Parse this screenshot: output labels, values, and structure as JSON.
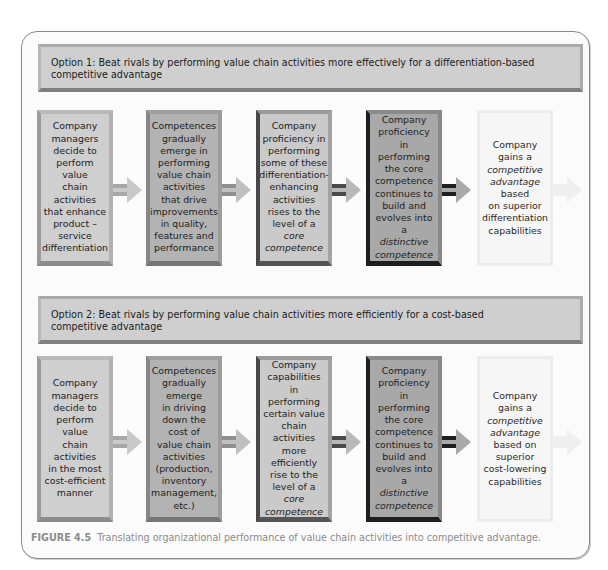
{
  "top_clipped_text": "competitive advantage — partially cut off page text above the figure",
  "option1": {
    "header": "Option 1: Beat rivals by performing value chain activities more effectively for a differentiation-based competitive advantage",
    "header_line1": "Option 1: Beat rivals by performing value chain activities more effectively for a differentiation-based",
    "header_line2": "competitive advantage",
    "boxes": [
      {
        "lines": [
          "Company",
          "managers",
          "decide to",
          "perform",
          "value",
          "chain",
          "activities",
          "that enhance",
          "product –",
          "service",
          "differentiation"
        ]
      },
      {
        "lines": [
          "Competences",
          "gradually",
          "emerge in",
          "performing",
          "value chain",
          "activities",
          "that drive",
          "improvements",
          "in quality,",
          "features and",
          "performance"
        ]
      },
      {
        "lines": [
          "Company",
          "proficiency in",
          "performing",
          "some of these",
          "differentiation-",
          "enhancing",
          "activities",
          "rises to the",
          "level of a",
          "core",
          "competence"
        ],
        "italic_from": 9
      },
      {
        "lines": [
          "Company",
          "proficiency in",
          "performing",
          "the core",
          "competence",
          "continues to",
          "build and",
          "evolves into a",
          "distinctive",
          "competence"
        ],
        "italic_from": 8
      },
      {
        "lines": [
          "Company",
          "gains a",
          "competitive",
          "advantage",
          "based",
          "on superior",
          "differentiation",
          "capabilities"
        ],
        "italic_lines": [
          2,
          3
        ]
      }
    ]
  },
  "option2": {
    "header": "Option 2: Beat rivals by performing value chain activities more efficiently for a cost-based competitive advantage",
    "header_line1": "Option 2: Beat rivals by performing value chain activities more efficiently for a cost-based",
    "header_line2": "competitive advantage",
    "boxes": [
      {
        "lines": [
          "Company",
          "managers",
          "decide to",
          "perform",
          "value",
          "chain",
          "activities",
          "in the most",
          "cost-efficient",
          "manner"
        ]
      },
      {
        "lines": [
          "Competences",
          "gradually",
          "emerge",
          "in driving",
          "down the",
          "cost of",
          "value chain",
          "activities",
          "(production,",
          "inventory",
          "management,",
          "etc.)"
        ]
      },
      {
        "lines": [
          "Company",
          "capabilities in",
          "performing",
          "certain value",
          "chain activities",
          "more",
          "efficiently",
          "rise to the",
          "level of a",
          "core",
          "competence"
        ],
        "italic_from": 9
      },
      {
        "lines": [
          "Company",
          "proficiency in",
          "performing",
          "the core",
          "competence",
          "continues to",
          "build and",
          "evolves into a",
          "distinctive",
          "competence"
        ],
        "italic_from": 8
      },
      {
        "lines": [
          "Company",
          "gains a",
          "competitive",
          "advantage",
          "based on",
          "superior",
          "cost-lowering",
          "capabilities"
        ],
        "italic_lines": [
          2,
          3
        ]
      }
    ]
  },
  "arrows": {
    "icon": "right-arrow-icon",
    "colors": [
      "#c4c4c4",
      "#b6b6b6",
      "#a0a0a0",
      "#2a2a2a"
    ],
    "final_arrow_color": "#ececec"
  },
  "caption": {
    "label": "FIGURE 4.5",
    "text": "Translating organizational performance of value chain activities into competitive advantage."
  },
  "colors": {
    "panel_border": "#8a8a8a",
    "header_bg": "#cfcfcf",
    "box1_bg": "#cfcfcf",
    "box2_bg": "#b3b3b3",
    "box3_bg": "#cacaca",
    "box4_bg": "#a8a8a8",
    "box5_bg": "#f6f6f6",
    "caption_color": "#8b8b8b"
  }
}
